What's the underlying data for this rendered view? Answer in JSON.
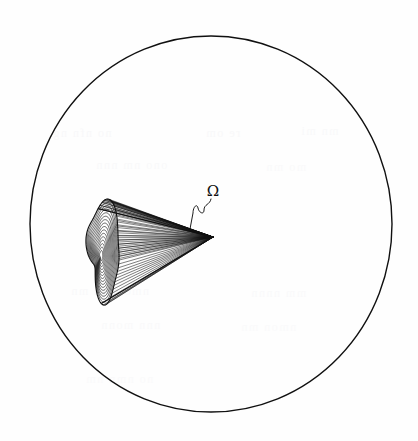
{
  "figure": {
    "kind": "scientific-line-drawing",
    "background_color": "#fefefe",
    "ink_color": "#101010",
    "canvas": {
      "width": 418,
      "height": 441
    },
    "boundary_circle": {
      "name": "sphere-outline",
      "center_x": 211,
      "center_y": 224,
      "radius_x": 181,
      "radius_y": 188,
      "stroke_width": 1.4
    },
    "cone": {
      "name": "solid-angle-cone",
      "apex_x": 213,
      "apex_y": 237,
      "ray_count": 34,
      "ray_stroke_width": 0.55,
      "base_center_x": 101,
      "base_center_y": 256,
      "contour_count": 15,
      "contour_stroke_width": 0.65
    },
    "label": {
      "name": "omega-label",
      "text": "Ω",
      "x": 213,
      "y": 196,
      "leader_line": {
        "name": "omega-leader-line",
        "style": "squiggle",
        "from_x": 211,
        "from_y": 199,
        "to_x": 190,
        "to_y": 229
      }
    },
    "ghost_marks": [
      {
        "text": "no nfn ng",
        "x": 52,
        "y": 126,
        "opacity": 0.55
      },
      {
        "text": "re om",
        "x": 205,
        "y": 126,
        "opacity": 0.5
      },
      {
        "text": "mn mi",
        "x": 300,
        "y": 124,
        "opacity": 0.45
      },
      {
        "text": "ono nm nnn",
        "x": 95,
        "y": 158,
        "opacity": 0.45
      },
      {
        "text": "mo mn",
        "x": 265,
        "y": 160,
        "opacity": 0.4
      },
      {
        "text": "nmo nmn mn",
        "x": 70,
        "y": 284,
        "opacity": 0.45
      },
      {
        "text": "mm nnnn",
        "x": 250,
        "y": 286,
        "opacity": 0.4
      },
      {
        "text": "nnn monn",
        "x": 100,
        "y": 318,
        "opacity": 0.4
      },
      {
        "text": "nmon mn",
        "x": 240,
        "y": 320,
        "opacity": 0.35
      },
      {
        "text": "no nmn nm",
        "x": 85,
        "y": 372,
        "opacity": 0.35
      }
    ]
  }
}
